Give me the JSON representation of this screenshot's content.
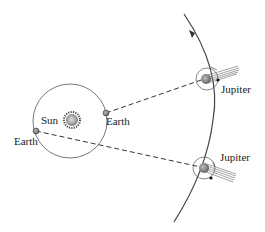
{
  "diagram": {
    "labels": {
      "sun": "Sun",
      "earth_1": "Earth",
      "earth_2": "Earth",
      "jupiter_1": "Jupiter",
      "jupiter_2": "Jupiter"
    },
    "colors": {
      "orbit": "#555555",
      "jupiter_orbit": "#444444",
      "dashed_line": "#333333",
      "planet": "#888888",
      "sun": "#999999",
      "text": "#222222"
    }
  }
}
